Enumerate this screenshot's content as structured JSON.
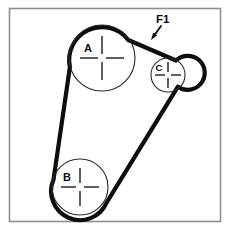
{
  "figure": {
    "background_color": "#ffffff",
    "frame_color": "#8d8f94",
    "belt_color": "#0d0d0d",
    "pulley_outline_color": "#2b2b2b"
  },
  "pulleys": [
    {
      "id": "A",
      "label": "A",
      "cx": 102,
      "cy": 58,
      "r": 33,
      "label_x": 88,
      "label_y": 52
    },
    {
      "id": "B",
      "label": "B",
      "cx": 80,
      "cy": 187,
      "r": 28,
      "label_x": 67,
      "label_y": 181
    },
    {
      "id": "C",
      "label": "C",
      "cx": 168,
      "cy": 75,
      "r": 17,
      "label_x": 158,
      "label_y": 71
    }
  ],
  "annotations": [
    {
      "id": "F1",
      "label": "F1",
      "label_x": 156,
      "label_y": 23,
      "leader_start_x": 160,
      "leader_start_y": 27,
      "leader_end_x": 152,
      "leader_end_y": 39
    }
  ],
  "frame": {
    "x": 9,
    "y": 8,
    "width": 212,
    "height": 214
  }
}
